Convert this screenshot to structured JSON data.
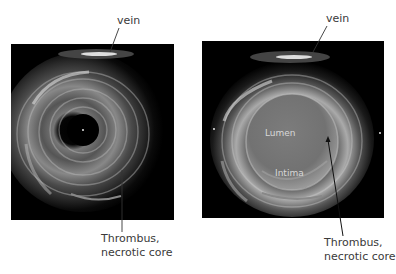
{
  "figure": {
    "left_panel": {
      "description": "Intravascular ultrasound cross-section, unannotated",
      "labels": {
        "top": "vein",
        "bottom_line1": "Thrombus,",
        "bottom_line2": "necrotic core"
      }
    },
    "right_panel": {
      "description": "Intravascular ultrasound cross-section with lumen and intima regions highlighted",
      "labels": {
        "top": "vein",
        "lumen": "Lumen",
        "intima": "Intima",
        "bottom_line1": "Thrombus,",
        "bottom_line2": "necrotic core"
      }
    }
  },
  "colors": {
    "background": "#ffffff",
    "image_background": "#000000",
    "label_text": "#3a3a3a",
    "inner_label_text": "#d8d8d8",
    "lumen_overlay": "#7a7a7a"
  }
}
